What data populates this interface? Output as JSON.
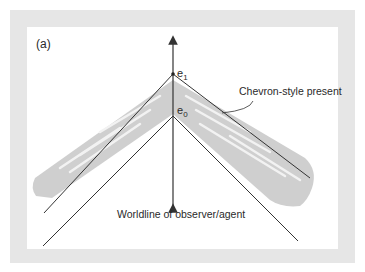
{
  "figure": {
    "panel_label": "(a)",
    "labels": {
      "event_top": "e",
      "event_top_sub": "1",
      "event_bottom": "e",
      "event_bottom_sub": "0",
      "present_annotation": "Chevron-style present",
      "worldline_annotation": "Worldline of observer/agent"
    },
    "colors": {
      "frame": "#e6e6e6",
      "panel": "#ffffff",
      "shading": "#cfcfcf",
      "lines": "#333333"
    }
  }
}
